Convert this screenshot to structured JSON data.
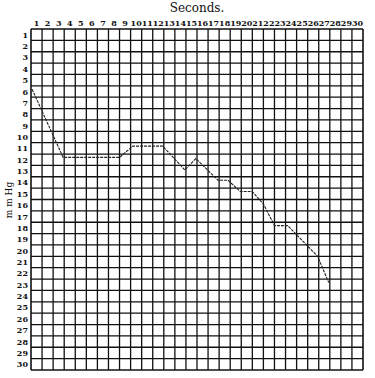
{
  "chart_data": {
    "type": "line",
    "title": "Seconds.",
    "xlabel": "Seconds.",
    "ylabel": "m m Hg",
    "x_ticks": [
      1,
      2,
      3,
      4,
      5,
      6,
      7,
      8,
      9,
      10,
      11,
      12,
      13,
      14,
      15,
      16,
      17,
      18,
      19,
      20,
      21,
      22,
      23,
      24,
      25,
      26,
      27,
      28,
      29,
      30
    ],
    "y_ticks": [
      1,
      2,
      3,
      4,
      5,
      6,
      7,
      8,
      9,
      10,
      11,
      12,
      13,
      14,
      15,
      16,
      17,
      18,
      19,
      20,
      21,
      22,
      23,
      24,
      25,
      26,
      27,
      28,
      29,
      30
    ],
    "xlim": [
      0.5,
      30.5
    ],
    "ylim": [
      30.5,
      0.5
    ],
    "y_inverted": true,
    "grid": true,
    "x_axis_position": "top",
    "series": [
      {
        "name": "pressure",
        "x": [
          0.6,
          3.4,
          8.5,
          9.7,
          12.4,
          14.4,
          15.4,
          17.4,
          18.3,
          19.4,
          20.5,
          21.5,
          22.5,
          23.7,
          26.4,
          27.4
        ],
        "y": [
          5.8,
          11.8,
          11.8,
          10.8,
          10.8,
          12.9,
          11.9,
          13.8,
          13.8,
          14.8,
          14.8,
          15.9,
          17.8,
          17.8,
          20.5,
          22.8
        ]
      }
    ]
  }
}
